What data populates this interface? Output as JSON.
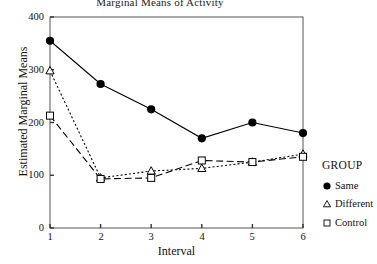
{
  "chart_data": {
    "type": "line",
    "title": "Marginal Means of Activity",
    "xlabel": "Interval",
    "ylabel": "Estimated Marginal Means",
    "x": [
      1,
      2,
      3,
      4,
      5,
      6
    ],
    "categories": [
      "1",
      "2",
      "3",
      "4",
      "5",
      "6"
    ],
    "xtick_labels": [
      "1",
      "2",
      "3",
      "4",
      "5",
      "6"
    ],
    "ytick_labels": [
      "0",
      "100",
      "200",
      "300",
      "400"
    ],
    "ytick_values": [
      0,
      100,
      200,
      300,
      400
    ],
    "ylim": [
      0,
      400
    ],
    "xlim": [
      1,
      6
    ],
    "grid": false,
    "legend_position": "right",
    "legend_title": "GROUP",
    "series": [
      {
        "name": "Same",
        "marker": "filled-circle",
        "line_style": "solid",
        "color": "#000000",
        "values": [
          355,
          273,
          225,
          170,
          200,
          180
        ]
      },
      {
        "name": "Different",
        "marker": "open-triangle",
        "line_style": "dotted",
        "color": "#000000",
        "values": [
          298,
          95,
          108,
          113,
          125,
          140
        ]
      },
      {
        "name": "Control",
        "marker": "open-square",
        "line_style": "dashed",
        "color": "#000000",
        "values": [
          213,
          93,
          95,
          128,
          125,
          135
        ]
      }
    ]
  },
  "legend": {
    "title": "GROUP",
    "items": [
      {
        "label": "Same",
        "icon": "filled-circle-icon"
      },
      {
        "label": "Different",
        "icon": "open-triangle-icon"
      },
      {
        "label": "Control",
        "icon": "open-square-icon"
      }
    ]
  },
  "axes": {
    "frame_color": "#555555",
    "tick_color": "#333333"
  }
}
